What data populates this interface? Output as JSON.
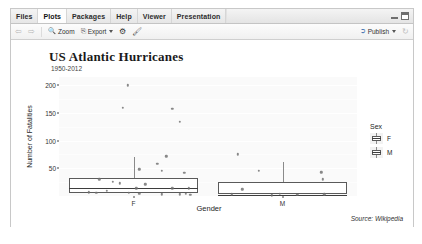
{
  "window": {
    "tabs": [
      {
        "label": "Files",
        "active": false
      },
      {
        "label": "Plots",
        "active": true
      },
      {
        "label": "Packages",
        "active": false
      },
      {
        "label": "Help",
        "active": false
      },
      {
        "label": "Viewer",
        "active": false
      },
      {
        "label": "Presentation",
        "active": false
      }
    ],
    "controls": {
      "minimize": "minimize-icon",
      "maximize": "maximize-icon"
    }
  },
  "toolbar": {
    "back_icon": "back-arrow-icon",
    "forward_icon": "forward-arrow-icon",
    "zoom_label": "Zoom",
    "zoom_icon": "magnifier-icon",
    "export_label": "Export",
    "export_icon": "export-icon",
    "export_caret": "chevron-down-icon",
    "remove_icon": "gear-icon",
    "clear_icon": "broom-icon",
    "publish_label": "Publish",
    "publish_icon": "publish-icon",
    "publish_caret": "chevron-down-icon",
    "refresh_icon": "refresh-icon"
  },
  "chart_data": {
    "type": "boxplot",
    "title": "US Atlantic Hurricanes",
    "subtitle": "1950-2012",
    "caption": "Source: Wikipedia",
    "xlabel": "Gender",
    "ylabel": "Number of Fatalities",
    "categories": [
      "F",
      "M"
    ],
    "ylim": [
      0,
      215
    ],
    "yticks": [
      50,
      100,
      150,
      200
    ],
    "ytick_labels": [
      "50",
      "100",
      "150",
      "200"
    ],
    "grid": true,
    "legend": {
      "title": "Sex",
      "position": "right",
      "entries": [
        {
          "label": "F",
          "key": "boxplot-glyph"
        },
        {
          "label": "M",
          "key": "boxplot-glyph"
        }
      ]
    },
    "series": [
      {
        "name": "F",
        "q1": 5,
        "median": 14,
        "q3": 33,
        "whisker_low": 1,
        "whisker_high": 70,
        "points": [
          {
            "x": 0.96,
            "y": 200
          },
          {
            "x": 0.93,
            "y": 159
          },
          {
            "x": 1.26,
            "y": 158
          },
          {
            "x": 1.31,
            "y": 134
          },
          {
            "x": 1.22,
            "y": 72
          },
          {
            "x": 1.16,
            "y": 58
          },
          {
            "x": 1.04,
            "y": 48
          },
          {
            "x": 1.19,
            "y": 46
          },
          {
            "x": 1.34,
            "y": 42
          },
          {
            "x": 0.77,
            "y": 30
          },
          {
            "x": 0.86,
            "y": 26
          },
          {
            "x": 0.91,
            "y": 23
          },
          {
            "x": 1.08,
            "y": 21
          },
          {
            "x": 1.02,
            "y": 14
          },
          {
            "x": 1.26,
            "y": 14
          },
          {
            "x": 1.37,
            "y": 14
          },
          {
            "x": 0.7,
            "y": 7
          },
          {
            "x": 0.75,
            "y": 6
          },
          {
            "x": 0.82,
            "y": 9
          },
          {
            "x": 0.97,
            "y": 6
          },
          {
            "x": 1.04,
            "y": 4
          },
          {
            "x": 1.19,
            "y": 3
          },
          {
            "x": 1.31,
            "y": 3
          },
          {
            "x": 1.35,
            "y": 4
          },
          {
            "x": 1.38,
            "y": 2
          }
        ]
      },
      {
        "name": "M",
        "q1": 4,
        "median": 2,
        "q3": 26,
        "whisker_low": 1,
        "whisker_high": 62,
        "points": [
          {
            "x": 1.7,
            "y": 75
          },
          {
            "x": 1.84,
            "y": 45
          },
          {
            "x": 2.26,
            "y": 43
          },
          {
            "x": 2.27,
            "y": 30
          },
          {
            "x": 1.73,
            "y": 12
          },
          {
            "x": 1.66,
            "y": 3
          },
          {
            "x": 1.98,
            "y": 4
          },
          {
            "x": 1.93,
            "y": 1
          },
          {
            "x": 2.1,
            "y": 2
          },
          {
            "x": 2.28,
            "y": 3
          }
        ]
      }
    ]
  }
}
